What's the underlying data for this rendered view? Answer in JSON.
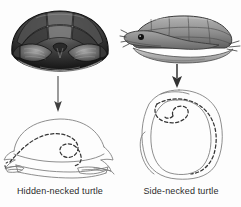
{
  "figure": {
    "background_color": "#fdfdfd",
    "text_color": "#2b2b2b",
    "line_color": "#6f6f6f",
    "dash_color": "#3a3a3a",
    "arrow_color": "#4a4a4a"
  },
  "panels": [
    {
      "id": "hidden-necked",
      "caption": "Hidden-necked turtle",
      "photo": {
        "view": "front view of domed carapace",
        "shell_dark": "#1c1c1c",
        "shell_mid": "#6e6e6e",
        "shell_light": "#b9b9b9",
        "plastron": "#e8e8e8"
      },
      "arrow": {
        "direction": "down",
        "length_px": 40,
        "style": "thin"
      },
      "diagram": {
        "view": "lateral section",
        "neck_retraction": "vertical S-curve",
        "outline_style": "solid",
        "neck_style": "dashed"
      }
    },
    {
      "id": "side-necked",
      "caption": "Side-necked turtle",
      "photo": {
        "view": "lateral view with head folded sideways",
        "shell_dark": "#5a5a5a",
        "shell_mid": "#8d8d8d",
        "shell_light": "#c4c4c4",
        "plastron": "#d8d8d8",
        "eye_color": "#141414"
      },
      "arrow": {
        "direction": "down",
        "length_px": 24,
        "style": "thick"
      },
      "diagram": {
        "view": "dorsal section",
        "neck_retraction": "horizontal sideways fold",
        "outline_style": "solid",
        "neck_style": "dashed"
      }
    }
  ]
}
